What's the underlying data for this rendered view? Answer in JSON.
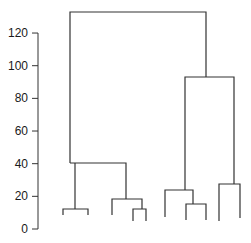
{
  "chart_data": {
    "type": "dendrogram",
    "title": "",
    "xlabel": "",
    "ylabel": "",
    "ylim": [
      0,
      120
    ],
    "y_ticks": [
      0,
      20,
      40,
      60,
      80,
      100,
      120
    ],
    "y_tick_labels": [
      "0",
      "20",
      "40",
      "60",
      "80",
      "100",
      "120"
    ],
    "grid": false,
    "legend": null,
    "leaf_count": 10,
    "merges": [
      {
        "id": "m1",
        "height": 12,
        "children": [
          "leaf1",
          "leaf2"
        ]
      },
      {
        "id": "m2",
        "height": 10,
        "children": [
          "leaf4",
          "leaf5"
        ]
      },
      {
        "id": "m3",
        "height": 19,
        "children": [
          "leaf3",
          "m2"
        ]
      },
      {
        "id": "m4",
        "height": 40,
        "children": [
          "m1",
          "m3"
        ]
      },
      {
        "id": "m5",
        "height": 15,
        "children": [
          "leaf7",
          "leaf8"
        ]
      },
      {
        "id": "m6",
        "height": 24,
        "children": [
          "leaf6",
          "m5"
        ]
      },
      {
        "id": "m7",
        "height": 27,
        "children": [
          "leaf9",
          "leaf10"
        ]
      },
      {
        "id": "m8",
        "height": 93,
        "children": [
          "m6",
          "m7"
        ]
      },
      {
        "id": "m9",
        "height": 133,
        "children": [
          "m4",
          "m8"
        ]
      }
    ]
  },
  "axis": {
    "color": "#333333",
    "x": 38,
    "y0_px": 229,
    "px_per_unit": 1.633
  },
  "segments": [
    {
      "name": "root-merge",
      "pts": [
        [
          70,
          163
        ],
        [
          70,
          12
        ],
        [
          206,
          12
        ],
        [
          206,
          77
        ]
      ]
    },
    {
      "name": "left-cluster-merge",
      "pts": [
        [
          70,
          163
        ],
        [
          126,
          163
        ],
        [
          126,
          199
        ]
      ]
    },
    {
      "name": "pair-1-2",
      "pts": [
        [
          63,
          215
        ],
        [
          63,
          209
        ],
        [
          88,
          209
        ],
        [
          88,
          215
        ]
      ]
    },
    {
      "name": "left-pair-stem",
      "pts": [
        [
          75,
          209
        ],
        [
          75,
          163
        ]
      ]
    },
    {
      "name": "subgroup-3-45",
      "pts": [
        [
          112,
          215
        ],
        [
          112,
          199
        ],
        [
          142,
          199
        ],
        [
          142,
          209
        ]
      ]
    },
    {
      "name": "pair-4-5",
      "pts": [
        [
          133,
          221
        ],
        [
          133,
          209
        ],
        [
          146,
          209
        ],
        [
          146,
          221
        ]
      ]
    },
    {
      "name": "right-cluster-merge",
      "pts": [
        [
          185,
          190
        ],
        [
          185,
          77
        ],
        [
          234,
          77
        ],
        [
          234,
          184
        ]
      ]
    },
    {
      "name": "subgroup-6-78",
      "pts": [
        [
          165,
          217
        ],
        [
          165,
          190
        ],
        [
          193,
          190
        ],
        [
          193,
          204
        ]
      ]
    },
    {
      "name": "pair-7-8",
      "pts": [
        [
          186,
          220
        ],
        [
          186,
          204
        ],
        [
          206,
          204
        ],
        [
          206,
          220
        ]
      ]
    },
    {
      "name": "pair-9-10",
      "pts": [
        [
          219,
          221
        ],
        [
          219,
          184
        ],
        [
          240,
          184
        ],
        [
          240,
          218
        ]
      ]
    }
  ]
}
